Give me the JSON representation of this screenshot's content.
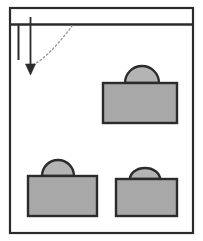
{
  "figure": {
    "width": 203,
    "height": 241,
    "background_color": "#ffffff"
  },
  "colors": {
    "stroke": "#2b2b2b",
    "body_fill": "#a8a8a8",
    "shackle_fill": "#b4b4b4",
    "dotted_curve": "#9a9a9a",
    "frame_fill": "#ffffff"
  },
  "frame": {
    "name": "outer-frame",
    "x": 10,
    "y": 8,
    "width": 183,
    "height": 225,
    "stroke_width": 2.2
  },
  "rail": {
    "name": "horizontal-rail",
    "label": "",
    "x1": 11,
    "y1": 24.5,
    "x2": 192,
    "y2": 24.5,
    "stroke_width": 2.4
  },
  "hanger_lines": [
    {
      "name": "hanger-line-left",
      "x1": 18.5,
      "y1": 25,
      "x2": 18.5,
      "y2": 60,
      "stroke_width": 2.0,
      "has_arrowhead": false
    },
    {
      "name": "hanger-line-right",
      "x1": 30.5,
      "y1": 17,
      "x2": 30.5,
      "y2": 64,
      "stroke_width": 1.8,
      "has_arrowhead": true
    }
  ],
  "arrowhead": {
    "name": "downward-arrowhead",
    "tip_x": 30.5,
    "tip_y": 75,
    "half_width": 5,
    "height": 11
  },
  "dotted_curve": {
    "name": "dotted-trajectory-curve",
    "start_x": 29,
    "start_y": 66,
    "control_x": 44,
    "control_y": 63,
    "end_x": 72,
    "end_y": 26,
    "dash_pattern": "1.6 2.6",
    "stroke_width": 1.4
  },
  "locks": [
    {
      "name": "lock-top-right",
      "body": {
        "x": 103,
        "y": 83,
        "width": 74,
        "height": 40
      },
      "shackle": {
        "cx": 142,
        "cy": 83,
        "rx": 17,
        "ry": 17
      },
      "stroke_width": 2.4
    },
    {
      "name": "lock-bottom-left",
      "body": {
        "x": 28,
        "y": 176,
        "width": 69,
        "height": 40
      },
      "shackle": {
        "cx": 58,
        "cy": 176,
        "rx": 16,
        "ry": 16
      },
      "stroke_width": 2.4
    },
    {
      "name": "lock-bottom-right",
      "body": {
        "x": 116,
        "y": 179,
        "width": 61,
        "height": 37
      },
      "shackle": {
        "cx": 145,
        "cy": 179,
        "rx": 15,
        "ry": 11
      },
      "stroke_width": 2.4
    }
  ]
}
